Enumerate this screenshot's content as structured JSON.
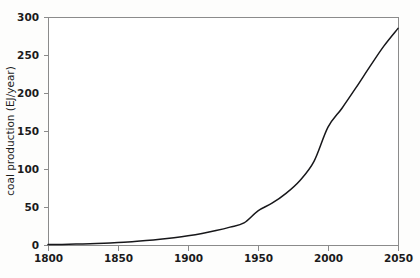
{
  "chart_data": {
    "type": "line",
    "title": "",
    "subtitle": "",
    "xlabel": "",
    "ylabel": "coal production (EJ/year)",
    "xlim": [
      1800,
      2050
    ],
    "ylim": [
      0,
      300
    ],
    "grid": false,
    "legend": null,
    "x_ticks": [
      1800,
      1850,
      1900,
      1950,
      2000,
      2050
    ],
    "x_tick_labels": [
      "1800",
      "1850",
      "1900",
      "1950",
      "2000",
      "2050"
    ],
    "y_ticks": [
      0,
      50,
      100,
      150,
      200,
      250,
      300
    ],
    "y_tick_labels": [
      "0",
      "50",
      "100",
      "150",
      "200",
      "250",
      "300"
    ],
    "series": [
      {
        "name": "coal production",
        "color": "#17171a",
        "x": [
          1800,
          1810,
          1820,
          1830,
          1840,
          1850,
          1860,
          1870,
          1880,
          1890,
          1900,
          1910,
          1920,
          1930,
          1940,
          1950,
          1960,
          1970,
          1980,
          1990,
          2000,
          2010,
          2020,
          2030,
          2040,
          2050
        ],
        "values": [
          0.5,
          0.8,
          1.2,
          1.7,
          2.4,
          3.3,
          4.4,
          5.8,
          7.5,
          9.6,
          12.1,
          15.2,
          19.0,
          23.5,
          29.0,
          45.0,
          55.0,
          68.0,
          85.0,
          110.0,
          155.0,
          180.0,
          207.0,
          235.0,
          262.0,
          285.0
        ]
      }
    ]
  },
  "axes": {
    "plot_left_px": 48,
    "plot_right_px": 398,
    "plot_top_px": 17,
    "plot_bottom_px": 245
  }
}
